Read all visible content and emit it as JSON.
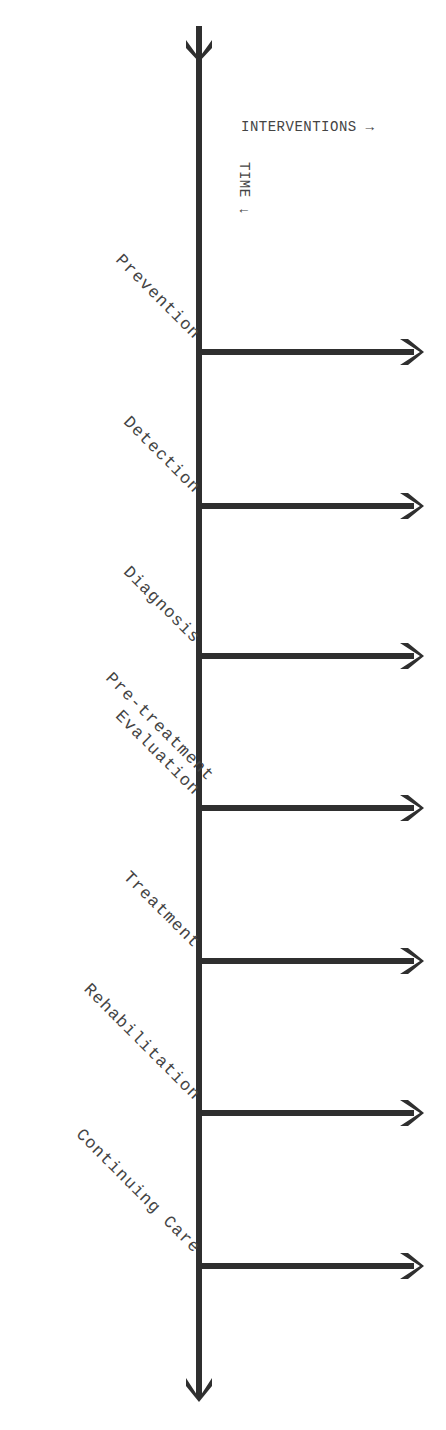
{
  "diagram": {
    "title": "",
    "axes": {
      "horizontal_label": "INTERVENTIONS →",
      "vertical_label": "TIME ↓"
    },
    "stages": [
      {
        "label": "Prevention",
        "y": 352
      },
      {
        "label": "Detection",
        "y": 506
      },
      {
        "label": "Diagnosis",
        "y": 656
      },
      {
        "label": "Pre-treatment\nEvaluation",
        "y": 808
      },
      {
        "label": "Treatment",
        "y": 961
      },
      {
        "label": "Rehabilitation",
        "y": 1113
      },
      {
        "label": "Continuing Care",
        "y": 1266
      }
    ],
    "colors": {
      "line": "#2f2f2f",
      "text": "#444444",
      "background": "#ffffff"
    }
  }
}
